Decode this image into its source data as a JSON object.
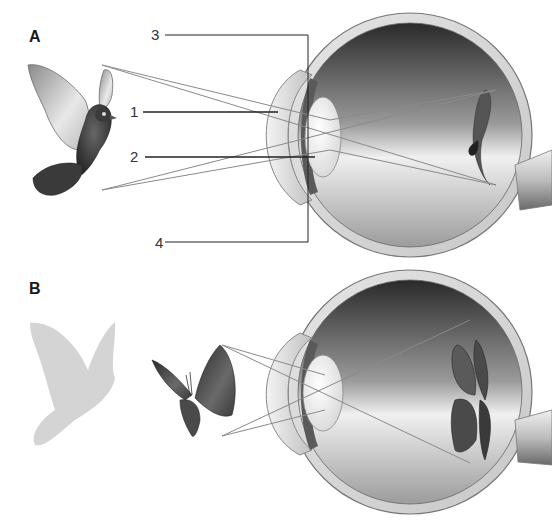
{
  "panels": {
    "a": {
      "label": "A"
    },
    "b": {
      "label": "B"
    }
  },
  "callouts": {
    "one": "1",
    "two": "2",
    "three": "3",
    "four": "4"
  },
  "colors": {
    "ray": "#8a8a8a",
    "leader": "#222222",
    "sclera": "#d8d8d8",
    "sclera_edge": "#777777",
    "interior_dark": "#3a3a3a",
    "interior_light": "#f2f2f2",
    "silhouette": "#d4d4d4"
  }
}
